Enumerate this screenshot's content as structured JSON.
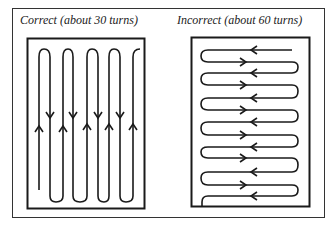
{
  "panels": {
    "left": {
      "caption": "Correct (about 30 turns)",
      "orientation": "vertical serpentine"
    },
    "right": {
      "caption": "Incorrect (about 60 turns)",
      "orientation": "horizontal serpentine"
    }
  },
  "colors": {
    "line": "#1a1a1a",
    "background": "#ffffff"
  }
}
